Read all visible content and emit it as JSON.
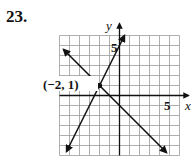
{
  "problem": {
    "number": "23."
  },
  "chart_data": {
    "type": "line",
    "title": "",
    "xlabel": "x",
    "ylabel": "y",
    "xlim": [
      -6,
      6
    ],
    "ylim": [
      -6,
      6
    ],
    "grid": true,
    "tick_labels": {
      "x": [
        "5"
      ],
      "y": [
        "5"
      ]
    },
    "series": [
      {
        "name": "y = -x - 1",
        "slope": -1,
        "intercept": -1,
        "endpoints": [
          [
            -5.6,
            4.6
          ],
          [
            4.7,
            -5.7
          ]
        ]
      },
      {
        "name": "y = 2x + 5",
        "slope": 2,
        "intercept": 5,
        "endpoints": [
          [
            -5.3,
            -5.6
          ],
          [
            0.5,
            6.0
          ]
        ]
      }
    ],
    "annotations": [
      {
        "label": "(−2, 1)",
        "x": -2,
        "y": 1,
        "marker": "dot"
      }
    ]
  },
  "labels": {
    "x_axis": "x",
    "y_axis": "y",
    "x_tick": "5",
    "y_tick": "5",
    "point": "(−2, 1)"
  }
}
